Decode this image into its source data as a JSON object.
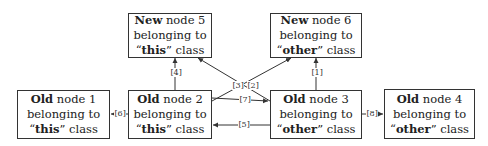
{
  "nodes": [
    {
      "id": "n5",
      "age": "New",
      "num": "node 5",
      "line2": "belonging to",
      "cls": "this",
      "cls_suffix": "class"
    },
    {
      "id": "n6",
      "age": "New",
      "num": "node 6",
      "line2": "belonging to",
      "cls": "other",
      "cls_suffix": "class"
    },
    {
      "id": "n1",
      "age": "Old",
      "num": "node 1",
      "line2": "belonging to",
      "cls": "this",
      "cls_suffix": "class"
    },
    {
      "id": "n2",
      "age": "Old",
      "num": "node 2",
      "line2": "belonging to",
      "cls": "this",
      "cls_suffix": "class"
    },
    {
      "id": "n3",
      "age": "Old",
      "num": "node 3",
      "line2": "belonging to",
      "cls": "other",
      "cls_suffix": "class"
    },
    {
      "id": "n4",
      "age": "Old",
      "num": "node 4",
      "line2": "belonging to",
      "cls": "other",
      "cls_suffix": "class"
    }
  ],
  "edges": [
    {
      "label": "[1]",
      "from": "node 3",
      "to": "node 6"
    },
    {
      "label": "[2]",
      "from": "node 2",
      "to": "node 6"
    },
    {
      "label": "[3]",
      "from": "node 3",
      "to": "node 5"
    },
    {
      "label": "[4]",
      "from": "node 2",
      "to": "node 5"
    },
    {
      "label": "[5]",
      "from": "node 3",
      "to": "node 2"
    },
    {
      "label": "[6]",
      "from": "node 2",
      "to": "node 1"
    },
    {
      "label": "[7]",
      "from": "node 2",
      "to": "node 3"
    },
    {
      "label": "[8]",
      "from": "node 3",
      "to": "node 4"
    }
  ],
  "quote_open": "“",
  "quote_close": "”"
}
